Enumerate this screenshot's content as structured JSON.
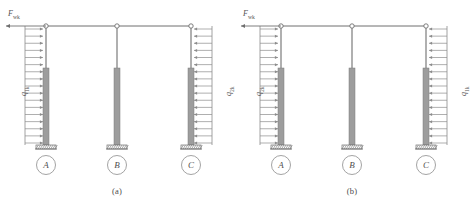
{
  "figure": {
    "panels": [
      {
        "id": "a",
        "caption": "(a)",
        "point_load": {
          "symbol": "F",
          "subscript": "wk",
          "direction": "left"
        },
        "left_load": {
          "symbol": "q",
          "subscript": "1k",
          "direction": "right"
        },
        "right_load": {
          "symbol": "q",
          "subscript": "2k",
          "direction": "left"
        },
        "columns": [
          {
            "label": "A",
            "support": "fixed"
          },
          {
            "label": "B",
            "support": "fixed"
          },
          {
            "label": "C",
            "support": "fixed"
          }
        ]
      },
      {
        "id": "b",
        "caption": "(b)",
        "point_load": {
          "symbol": "F",
          "subscript": "wk",
          "direction": "left"
        },
        "left_load": {
          "symbol": "q",
          "subscript": "2k",
          "direction": "right"
        },
        "right_load": {
          "symbol": "q",
          "subscript": "1k",
          "direction": "left"
        },
        "columns": [
          {
            "label": "A",
            "support": "fixed"
          },
          {
            "label": "B",
            "support": "fixed"
          },
          {
            "label": "C",
            "support": "fixed"
          }
        ]
      }
    ],
    "colors": {
      "column_fill": "#9d9d9d",
      "line": "#8c8c8c",
      "line_dark": "#6f6f6f",
      "text": "#555555"
    },
    "load_arrow_count": 17
  }
}
